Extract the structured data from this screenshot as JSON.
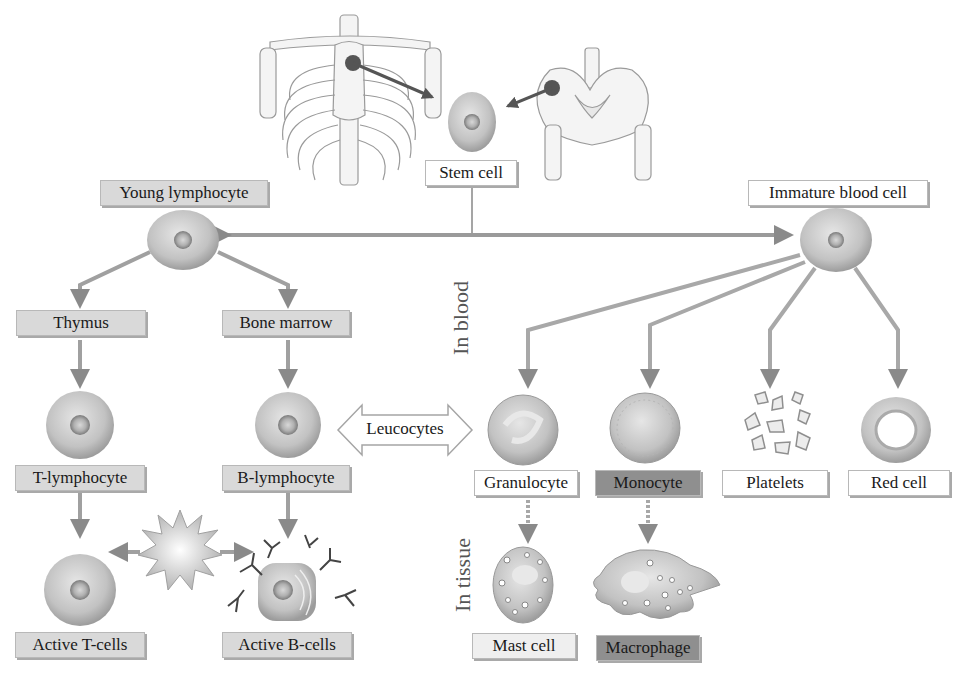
{
  "diagram": {
    "title_nodes": {
      "stem_cell": "Stem cell",
      "young_lymphocyte": "Young lymphocyte",
      "immature_blood_cell": "Immature blood cell"
    },
    "lymphoid_branch": {
      "thymus": "Thymus",
      "bone_marrow": "Bone marrow",
      "t_lymphocyte": "T-lymphocyte",
      "b_lymphocyte": "B-lymphocyte",
      "active_t_cells": "Active T-cells",
      "active_b_cells": "Active B-cells"
    },
    "leucocytes_label": "Leucocytes",
    "region_labels": {
      "in_blood": "In blood",
      "in_tissue": "In tissue"
    },
    "myeloid_branch": {
      "granulocyte": "Granulocyte",
      "monocyte": "Monocyte",
      "platelets": "Platelets",
      "red_cell": "Red cell",
      "mast_cell": "Mast cell",
      "macrophage": "Macrophage"
    },
    "illustrations": [
      "ribcage-skeleton",
      "pelvis-skeleton"
    ],
    "colors": {
      "label_gray": "#d9d9d9",
      "label_dark": "#8f8f8f",
      "arrow_gray": "#9a9a9a",
      "cell_fill": "#c4c4c4"
    }
  }
}
